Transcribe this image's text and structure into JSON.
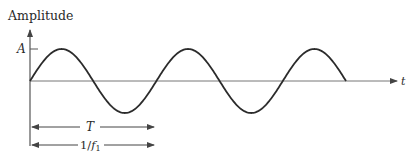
{
  "diagram": {
    "y_axis_label": "Amplitude",
    "x_axis_label": "t",
    "amplitude_label": "A",
    "period_label": "T",
    "frequency_label_prefix": "1/",
    "frequency_label_var": "f",
    "frequency_label_sub": "1",
    "cycles": 2.5,
    "colors": {
      "curve": "#2b2b2b",
      "axis": "#555555",
      "text": "#2a2a2a"
    }
  }
}
